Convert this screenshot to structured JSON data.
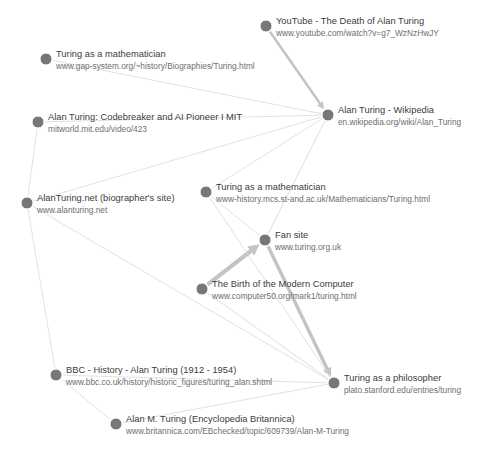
{
  "diagram": {
    "background_color": "#ffffff",
    "node_color": "#777777",
    "edge_color": "#d9d9d9",
    "arrow_color": "#c4c4c4",
    "caption": "",
    "nodes": [
      {
        "id": "youtube",
        "title": "YouTube - The Death of Alan Turing",
        "url": "www.youtube.com/watch?v=g7_WzNzHwJY",
        "x": 266,
        "y": 26
      },
      {
        "id": "gap-system",
        "title": "Turing as a mathematician",
        "url": "www.gap-system.org/~history/Biographies/Turing.html",
        "x": 46,
        "y": 59
      },
      {
        "id": "wikipedia",
        "title": "Alan Turing - Wikipedia",
        "url": "en.wikipedia.org/wiki/Alan_Turing",
        "x": 328,
        "y": 115
      },
      {
        "id": "mitworld",
        "title": "Alan Turing: Codebreaker and AI Pioneer I MIT",
        "url": "mitworld.mit.edu/video/423",
        "x": 38,
        "y": 122
      },
      {
        "id": "st-andrews",
        "title": "Turing as a mathematician",
        "url": "www-history.mcs.st-and.ac.uk/Mathematicians/Turing.html",
        "x": 206,
        "y": 192
      },
      {
        "id": "alanturing-net",
        "title": "AlanTuring.net (biographer's site)",
        "url": "www.alanturing.net",
        "x": 27,
        "y": 203
      },
      {
        "id": "fansite",
        "title": "Fan site",
        "url": "www.turing.org.uk",
        "x": 265,
        "y": 240
      },
      {
        "id": "computer50",
        "title": "The Birth of the Modern Computer",
        "url": "www.computer50.org/mark1/turing.html",
        "x": 202,
        "y": 289
      },
      {
        "id": "bbc",
        "title": "BBC - History - Alan Turing (1912 - 1954)",
        "url": "www.bbc.co.uk/history/historic_figures/turing_alan.shtml",
        "x": 56,
        "y": 375
      },
      {
        "id": "stanford",
        "title": "Turing as a philosopher",
        "url": "plato.stanford.edu/entries/turing",
        "x": 334,
        "y": 383
      },
      {
        "id": "britannica",
        "title": "Alan M. Turing (Encyclopedia Britannica)",
        "url": "www.britannica.com/EBchecked/topic/609739/Alan-M-Turing",
        "x": 116,
        "y": 424
      }
    ],
    "edges": [
      {
        "from": "youtube",
        "to": "wikipedia",
        "width": 2.6,
        "arrow": true
      },
      {
        "from": "gap-system",
        "to": "wikipedia",
        "width": 0.8,
        "arrow": false
      },
      {
        "from": "mitworld",
        "to": "wikipedia",
        "width": 0.8,
        "arrow": false
      },
      {
        "from": "alanturing-net",
        "to": "wikipedia",
        "width": 0.8,
        "arrow": false
      },
      {
        "from": "st-andrews",
        "to": "wikipedia",
        "width": 0.8,
        "arrow": false
      },
      {
        "from": "fansite",
        "to": "wikipedia",
        "width": 0.9,
        "arrow": false
      },
      {
        "from": "mitworld",
        "to": "alanturing-net",
        "width": 0.8,
        "arrow": false
      },
      {
        "from": "alanturing-net",
        "to": "bbc",
        "width": 0.8,
        "arrow": false
      },
      {
        "from": "alanturing-net",
        "to": "stanford",
        "width": 0.8,
        "arrow": false
      },
      {
        "from": "bbc",
        "to": "britannica",
        "width": 0.8,
        "arrow": false
      },
      {
        "from": "bbc",
        "to": "stanford",
        "width": 0.8,
        "arrow": false
      },
      {
        "from": "britannica",
        "to": "stanford",
        "width": 0.8,
        "arrow": false
      },
      {
        "from": "st-andrews",
        "to": "fansite",
        "width": 0.8,
        "arrow": false
      },
      {
        "from": "computer50",
        "to": "fansite",
        "width": 4.2,
        "arrow": true
      },
      {
        "from": "computer50",
        "to": "stanford",
        "width": 0.9,
        "arrow": false
      },
      {
        "from": "fansite",
        "to": "stanford",
        "width": 3.4,
        "arrow": true
      },
      {
        "from": "st-andrews",
        "to": "stanford",
        "width": 0.8,
        "arrow": false
      }
    ]
  }
}
